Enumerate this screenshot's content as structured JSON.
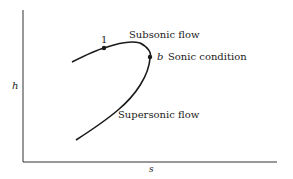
{
  "diagram": {
    "title": "",
    "axes": {
      "x_label": "s",
      "y_label": "h"
    },
    "curve": {
      "description": "Fanno line on h-s diagram",
      "upper_branch_label": "Subsonic flow",
      "lower_branch_label": "Supersonic flow"
    },
    "points": [
      {
        "id": "point-1",
        "label": "1"
      },
      {
        "id": "point-b",
        "label": "b",
        "annotation": "Sonic condition"
      }
    ],
    "colors": {
      "line": "#1a1a1a",
      "background": "#ffffff"
    }
  }
}
